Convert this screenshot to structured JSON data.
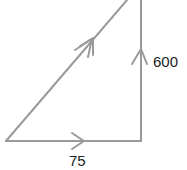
{
  "diagram": {
    "type": "vector-triangle",
    "stroke_color": "#9a9a9a",
    "text_color": "#222222",
    "vectors": [
      {
        "name": "horizontal",
        "label": "75",
        "direction": "right",
        "arrowheads": 1
      },
      {
        "name": "vertical",
        "label": "600",
        "direction": "up",
        "arrowheads": 1
      },
      {
        "name": "resultant",
        "label": "",
        "direction": "up-right",
        "arrowheads": 2
      }
    ]
  }
}
